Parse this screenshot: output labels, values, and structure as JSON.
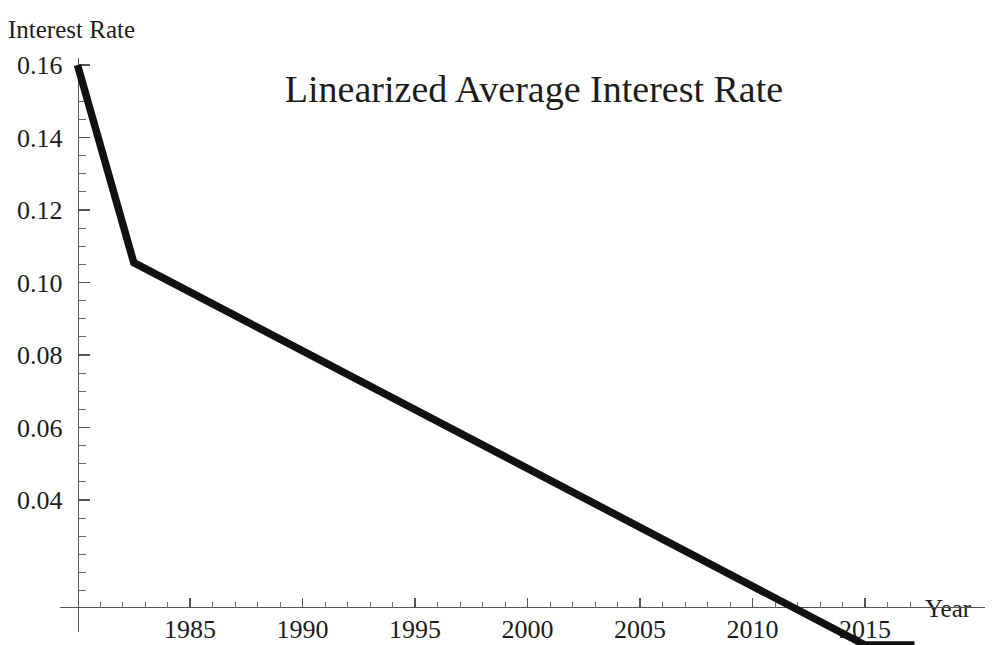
{
  "chart_data": {
    "type": "line",
    "title": "Linearized Average Interest Rate",
    "xlabel": "Year",
    "ylabel": "Interest Rate",
    "grid": false,
    "legend": null,
    "xlim": [
      1980,
      2017.2
    ],
    "ylim": [
      0.0,
      0.16
    ],
    "x_ticks_major": [
      1985,
      1990,
      1995,
      2000,
      2005,
      2010,
      2015
    ],
    "x_tick_labels": [
      "1985",
      "1990",
      "1995",
      "2000",
      "2005",
      "2010",
      "2015"
    ],
    "x_tick_minor_step": 1,
    "y_ticks_major": [
      0.04,
      0.06,
      0.08,
      0.1,
      0.12,
      0.14,
      0.16
    ],
    "y_tick_labels": [
      "0.04",
      "0.06",
      "0.08",
      "0.10",
      "0.12",
      "0.14",
      "0.16"
    ],
    "y_tick_minor_step": 0.005,
    "series": [
      {
        "name": "Linearized Average Interest Rate",
        "color": "#111111",
        "x": [
          1980.0,
          1982.5,
          2015.0,
          2017.2
        ],
        "values": [
          0.16,
          0.1055,
          0.0,
          0.0
        ]
      }
    ],
    "axis_color": "#555555",
    "background_color": "#ffffff"
  },
  "labels": {
    "title": "Linearized Average Interest Rate",
    "y_axis_label": "Interest Rate",
    "x_axis_label": "Year"
  }
}
